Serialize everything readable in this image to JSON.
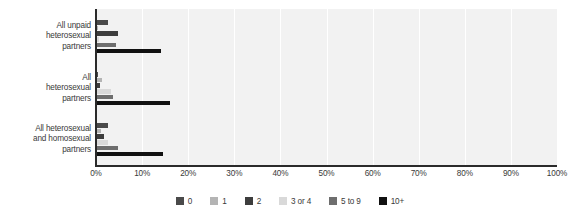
{
  "chart_data": {
    "type": "bar",
    "orientation": "horizontal",
    "title": "",
    "subtitle": "",
    "xlabel": "",
    "ylabel": "",
    "xlim": [
      0,
      100
    ],
    "grid": true,
    "legend_position": "bottom",
    "categories": [
      "All unpaid\nheterosexual\npartners",
      "All\nheterosexual\npartners",
      "All heterosexual\nand homosexual\npartners"
    ],
    "category_lines": [
      [
        "All unpaid",
        "heterosexual",
        "partners"
      ],
      [
        "All",
        "heterosexual",
        "partners"
      ],
      [
        "All heterosexual",
        "and homosexual",
        "partners"
      ]
    ],
    "xticks": [
      0,
      10,
      20,
      30,
      40,
      50,
      60,
      70,
      80,
      90,
      100
    ],
    "xtick_labels": [
      "0%",
      "10%",
      "20%",
      "30%",
      "40%",
      "50%",
      "60%",
      "70%",
      "80%",
      "90%",
      "100%"
    ],
    "series": [
      {
        "name": "0",
        "color": "#4a4a4a",
        "values": [
          2.5,
          0.4,
          2.7
        ]
      },
      {
        "name": "1",
        "color": "#b4b4b4",
        "values": [
          0.5,
          1.3,
          1.0
        ]
      },
      {
        "name": "2",
        "color": "#3d3d3d",
        "values": [
          4.7,
          0.8,
          1.7
        ]
      },
      {
        "name": "3 or 4",
        "color": "#d9d9d9",
        "values": [
          0.6,
          3.2,
          2.6
        ]
      },
      {
        "name": "5 to 9",
        "color": "#6e6e6e",
        "values": [
          4.3,
          3.6,
          4.8
        ]
      },
      {
        "name": "10+",
        "color": "#111111",
        "values": [
          14.0,
          16.0,
          14.6
        ]
      }
    ]
  },
  "legend": {
    "items": [
      {
        "label": "0",
        "color": "#4a4a4a"
      },
      {
        "label": "1",
        "color": "#b4b4b4"
      },
      {
        "label": "2",
        "color": "#3d3d3d"
      },
      {
        "label": "3 or 4",
        "color": "#d9d9d9"
      },
      {
        "label": "5 to 9",
        "color": "#6e6e6e"
      },
      {
        "label": "10+",
        "color": "#111111"
      }
    ]
  },
  "colors": {
    "plot_background": "#f2f2f2",
    "gridline": "#ffffff",
    "axis": "#2b2b2b",
    "text": "#3a3a3a",
    "page_background": "#ffffff"
  }
}
